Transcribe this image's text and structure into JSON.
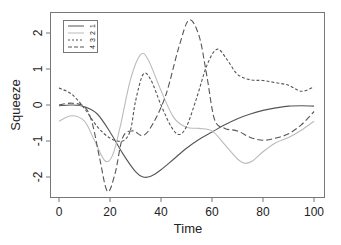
{
  "chart_data": {
    "type": "line",
    "title": "",
    "xlabel": "Time",
    "ylabel": "Squeeze",
    "xlim": [
      -3,
      105
    ],
    "ylim": [
      -2.55,
      2.55
    ],
    "xticks": [
      0,
      20,
      40,
      60,
      80,
      100
    ],
    "yticks": [
      -2,
      -1,
      0,
      1,
      2
    ],
    "grid": false,
    "legend_position": "top-left",
    "series": [
      {
        "name": "1",
        "style": "solid",
        "color": "#555555",
        "x": [
          0,
          5,
          10,
          15,
          20,
          25,
          30,
          33,
          36,
          40,
          45,
          50,
          55,
          60,
          65,
          70,
          75,
          80,
          85,
          90,
          95,
          100
        ],
        "y": [
          -0.02,
          0.0,
          -0.05,
          -0.25,
          -0.75,
          -1.35,
          -1.85,
          -2.0,
          -1.98,
          -1.8,
          -1.5,
          -1.2,
          -0.95,
          -0.75,
          -0.55,
          -0.38,
          -0.25,
          -0.15,
          -0.08,
          -0.03,
          -0.02,
          -0.03
        ]
      },
      {
        "name": "2",
        "style": "solid",
        "color": "#bbbbbb",
        "x": [
          0,
          5,
          10,
          14,
          18,
          21,
          24,
          28,
          32,
          35,
          40,
          45,
          50,
          55,
          60,
          65,
          70,
          73,
          76,
          80,
          85,
          90,
          95,
          100
        ],
        "y": [
          -0.45,
          -0.3,
          -0.45,
          -1.0,
          -1.55,
          -1.4,
          -0.6,
          0.7,
          1.4,
          1.25,
          0.4,
          -0.35,
          -0.62,
          -0.65,
          -0.72,
          -1.1,
          -1.5,
          -1.62,
          -1.55,
          -1.3,
          -1.05,
          -0.9,
          -0.7,
          -0.45
        ]
      },
      {
        "name": "3",
        "style": "short-dash",
        "color": "#555555",
        "x": [
          0,
          5,
          10,
          15,
          20,
          25,
          28,
          30,
          33,
          36,
          40,
          44,
          47,
          50,
          54,
          58,
          62,
          66,
          70,
          75,
          80,
          85,
          90,
          95,
          100
        ],
        "y": [
          0.47,
          0.3,
          -0.1,
          -0.6,
          -0.92,
          -1.0,
          -0.7,
          0.1,
          0.85,
          0.7,
          0.0,
          -0.6,
          -0.82,
          -0.6,
          0.2,
          1.1,
          1.55,
          1.25,
          0.85,
          0.7,
          0.68,
          0.62,
          0.55,
          0.38,
          0.5
        ]
      },
      {
        "name": "4",
        "style": "long-dash",
        "color": "#555555",
        "x": [
          0,
          5,
          10,
          13,
          16,
          19,
          22,
          25,
          29,
          33,
          37,
          42,
          47,
          51,
          55,
          58,
          61,
          65,
          70,
          75,
          80,
          85,
          90,
          95,
          100
        ],
        "y": [
          0.0,
          0.05,
          -0.05,
          -0.5,
          -1.5,
          -2.4,
          -1.9,
          -0.9,
          -0.72,
          -0.85,
          -0.5,
          0.3,
          1.6,
          2.36,
          1.9,
          0.8,
          -0.4,
          -0.65,
          -0.72,
          -0.9,
          -0.98,
          -0.92,
          -0.8,
          -0.55,
          -0.18
        ]
      }
    ]
  },
  "legend": {
    "entries": [
      "1",
      "2",
      "3",
      "4"
    ]
  }
}
